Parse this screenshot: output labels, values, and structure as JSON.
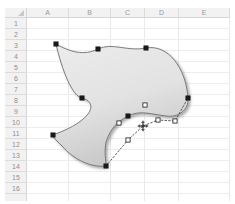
{
  "app": {
    "name": "spreadsheet-drawing-canvas",
    "background": "#ffffff"
  },
  "sheet": {
    "corner_label": "",
    "columns": [
      {
        "label": "A",
        "left": 0,
        "width": 42
      },
      {
        "label": "B",
        "left": 42,
        "width": 42
      },
      {
        "label": "C",
        "left": 84,
        "width": 34
      },
      {
        "label": "D",
        "left": 118,
        "width": 34
      },
      {
        "label": "E",
        "left": 152,
        "width": 51
      }
    ],
    "rows": [
      {
        "label": "1",
        "top": 0
      },
      {
        "label": "2",
        "top": 11
      },
      {
        "label": "3",
        "top": 22
      },
      {
        "label": "4",
        "top": 33
      },
      {
        "label": "5",
        "top": 44
      },
      {
        "label": "6",
        "top": 55
      },
      {
        "label": "7",
        "top": 66
      },
      {
        "label": "8",
        "top": 77
      },
      {
        "label": "9",
        "top": 88
      },
      {
        "label": "10",
        "top": 99
      },
      {
        "label": "11",
        "top": 110
      },
      {
        "label": "12",
        "top": 121
      },
      {
        "label": "13",
        "top": 132
      },
      {
        "label": "14",
        "top": 143
      },
      {
        "label": "15",
        "top": 154
      },
      {
        "label": "16",
        "top": 165
      }
    ],
    "colors": {
      "header_fill": "#f2f2f2",
      "header_text": "#939393",
      "header_border": "#d6d6d6",
      "gridline_vertical": "#e9e9e9",
      "gridline_horizontal": "#ededed",
      "cell_background": "#ffffff"
    }
  },
  "shape": {
    "name": "freeform-shape",
    "state": "edit-points",
    "outline_color": "#6e6e6e",
    "fill_top_color": "#eaeaea",
    "fill_bottom_color": "#c9c9c9",
    "shadow_color": "#bdbdbd",
    "path": "M 56 44 C 70 52, 84 56, 98 49 C 112 42, 128 52, 146 48 C 168 44, 186 68, 188 98 C 189 110, 178 118, 166 116 C 150 114, 140 110, 128 116 C 116 122, 110 130, 106 142 C 104 152, 106 160, 106 166 C 92 168, 74 160, 62 146 C 54 138, 52 136, 53 135 C 66 130, 80 124, 88 114 C 94 106, 90 100, 82 98 C 72 96, 62 70, 56 44 Z",
    "vertices": [
      {
        "id": "v1",
        "x": 56,
        "y": 44,
        "type": "filled",
        "cell": "A4"
      },
      {
        "id": "v2",
        "x": 98,
        "y": 49,
        "type": "filled",
        "cell": "B4"
      },
      {
        "id": "v3",
        "x": 146,
        "y": 48,
        "type": "filled",
        "cell": "D3"
      },
      {
        "id": "v4",
        "x": 188,
        "y": 98,
        "type": "filled",
        "cell": "E9"
      },
      {
        "id": "v5",
        "x": 128,
        "y": 116,
        "type": "filled",
        "cell": "C10"
      },
      {
        "id": "v6",
        "x": 106,
        "y": 166,
        "type": "filled",
        "cell": "C14"
      },
      {
        "id": "v7",
        "x": 53,
        "y": 135,
        "type": "filled",
        "cell": "A11"
      },
      {
        "id": "v8",
        "x": 82,
        "y": 98,
        "type": "filled",
        "cell": "B8"
      }
    ],
    "control_points": [
      {
        "id": "c1",
        "x": 145,
        "y": 105,
        "type": "hollow"
      },
      {
        "id": "c2",
        "x": 119,
        "y": 123,
        "type": "hollow"
      },
      {
        "id": "c3",
        "x": 158,
        "y": 120,
        "type": "hollow"
      },
      {
        "id": "c4",
        "x": 128,
        "y": 140,
        "type": "hollow"
      },
      {
        "id": "c5",
        "x": 175,
        "y": 121,
        "type": "hollow"
      }
    ],
    "tangent_line": {
      "style": "dotted",
      "color": "#4a4a4a",
      "points": "106,166 128,140 143,126 158,120 175,121 188,98"
    }
  },
  "cursor": {
    "type": "move-cursor",
    "x": 143,
    "y": 126
  }
}
